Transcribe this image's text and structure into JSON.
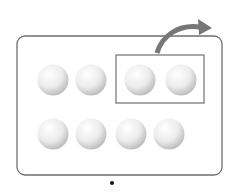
{
  "diagram": {
    "tray": {
      "x": 17,
      "y": 36,
      "w": 205,
      "h": 139,
      "stroke": "#6f6f6f"
    },
    "group_box": {
      "x": 116,
      "y": 55,
      "w": 88,
      "h": 48,
      "stroke": "#7a7a7a"
    },
    "balls": [
      {
        "cx": 53,
        "cy": 80
      },
      {
        "cx": 91,
        "cy": 80
      },
      {
        "cx": 140,
        "cy": 80
      },
      {
        "cx": 181,
        "cy": 80
      },
      {
        "cx": 53,
        "cy": 134
      },
      {
        "cx": 91,
        "cy": 134
      },
      {
        "cx": 131,
        "cy": 134
      },
      {
        "cx": 169,
        "cy": 134
      }
    ],
    "ball_radius": 15.5,
    "arrow_color": "#777777",
    "dot": {
      "cx": 112,
      "cy": 183
    },
    "counts": {
      "total": 8,
      "removed": 2
    }
  }
}
